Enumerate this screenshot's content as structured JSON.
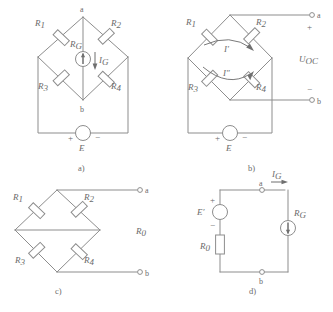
{
  "figure": {
    "colors": {
      "line": "#8d8d8d",
      "text": "#6b6b6b",
      "background": "#ffffff"
    },
    "panels": [
      {
        "id": "a",
        "caption": "a)",
        "resistors": [
          "R1",
          "R2",
          "R3",
          "R4"
        ],
        "resistor_labels": [
          {
            "base": "R",
            "sub": "1"
          },
          {
            "base": "R",
            "sub": "2"
          },
          {
            "base": "R",
            "sub": "3"
          },
          {
            "base": "R",
            "sub": "4"
          }
        ],
        "galvanometer": {
          "base": "R",
          "sub": "G"
        },
        "current": {
          "base": "I",
          "sub": "G"
        },
        "nodes": {
          "top": "a",
          "bottom": "b"
        },
        "source": {
          "base": "E",
          "plus": "+",
          "minus": "−"
        }
      },
      {
        "id": "b",
        "caption": "b)",
        "resistor_labels": [
          {
            "base": "R",
            "sub": "1"
          },
          {
            "base": "R",
            "sub": "2"
          },
          {
            "base": "R",
            "sub": "3"
          },
          {
            "base": "R",
            "sub": "4"
          }
        ],
        "loop_currents": [
          {
            "base": "I",
            "prime": "′"
          },
          {
            "base": "I",
            "prime": "″"
          }
        ],
        "terminals": {
          "top": "a",
          "bottom": "b"
        },
        "open_voltage": {
          "base": "U",
          "sub": "OC"
        },
        "polarity": {
          "plus": "+",
          "minus": "−"
        },
        "source": {
          "base": "E",
          "plus": "+",
          "minus": "−"
        }
      },
      {
        "id": "c",
        "caption": "c)",
        "resistor_labels": [
          {
            "base": "R",
            "sub": "1"
          },
          {
            "base": "R",
            "sub": "2"
          },
          {
            "base": "R",
            "sub": "3"
          },
          {
            "base": "R",
            "sub": "4"
          }
        ],
        "terminals": {
          "top": "a",
          "bottom": "b"
        },
        "equivalent_resistance": {
          "base": "R",
          "sub": "0"
        }
      },
      {
        "id": "d",
        "caption": "d)",
        "source": {
          "base": "E",
          "prime": "′",
          "plus": "+",
          "minus": "−"
        },
        "series_resistor": {
          "base": "R",
          "sub": "0"
        },
        "galvanometer": {
          "base": "R",
          "sub": "G"
        },
        "current": {
          "base": "I",
          "sub": "G"
        },
        "terminals": {
          "top": "a",
          "bottom": "b"
        }
      }
    ]
  }
}
